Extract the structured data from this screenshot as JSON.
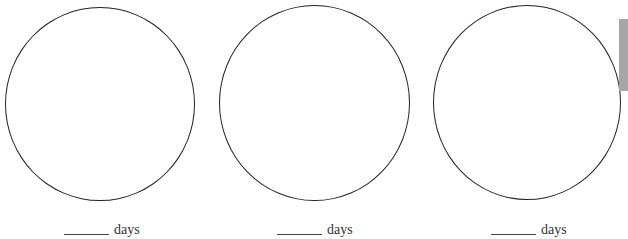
{
  "worksheet": {
    "items": [
      {
        "unit_label": "days"
      },
      {
        "unit_label": "days"
      },
      {
        "unit_label": "days"
      }
    ]
  },
  "colors": {
    "circle_stroke": "#222222",
    "side_tab": "#a6a6a6"
  }
}
